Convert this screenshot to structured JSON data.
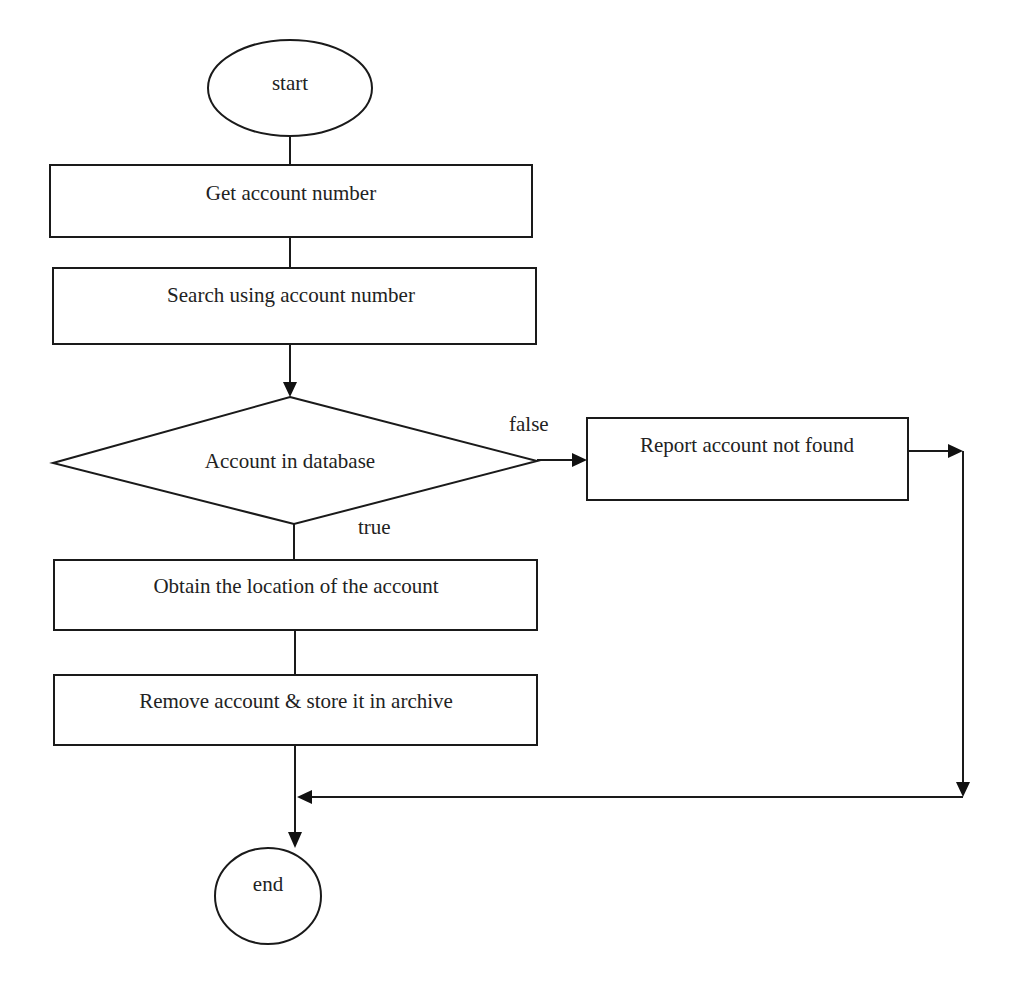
{
  "diagram": {
    "type": "flowchart",
    "nodes": {
      "start": "start",
      "get_account": "Get account number",
      "search": "Search using account number",
      "decision": "Account in database",
      "report": "Report account not found",
      "obtain": "Obtain the location of the account",
      "remove": "Remove account & store it in archive",
      "end": "end"
    },
    "edge_labels": {
      "false": "false",
      "true": "true"
    },
    "colors": {
      "stroke": "#1a1a1a",
      "text": "#222222",
      "background": "#ffffff"
    }
  }
}
